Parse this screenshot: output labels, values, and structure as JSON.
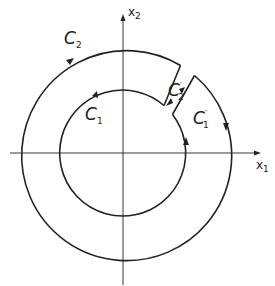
{
  "diagram": {
    "axes": {
      "x_label": "x",
      "x_sub": "1",
      "y_label": "x",
      "y_sub": "2"
    },
    "curves": [
      {
        "name": "C",
        "sub": "2",
        "sup": "",
        "role": "outer-circle"
      },
      {
        "name": "C",
        "sub": "1",
        "sup": "",
        "role": "inner-circle"
      },
      {
        "name": "C",
        "sub": "2",
        "sup": "′",
        "role": "cut-upper"
      },
      {
        "name": "C",
        "sub": "1",
        "sup": "′",
        "role": "cut-lower"
      }
    ]
  }
}
